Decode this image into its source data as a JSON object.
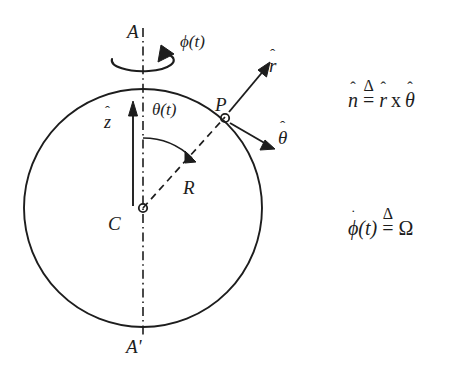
{
  "figure": {
    "background_color": "#ffffff",
    "stroke_color": "#1d1d1d",
    "labels": {
      "axis_top": "A",
      "axis_bottom": "A'",
      "spin_angle": "ϕ(t)",
      "polar_angle": "θ(t)",
      "z_axis_symbol": "z",
      "z_axis_hat": "ˆ",
      "radius": "R",
      "center": "C",
      "point": "P",
      "r_unit_symbol": "r",
      "r_unit_hat": "ˆ",
      "theta_unit_symbol": "θ",
      "theta_unit_hat": "ˆ"
    },
    "equations": {
      "normal_definition": {
        "lhs_symbol": "n",
        "lhs_hat": "ˆ",
        "relation": "=",
        "relation_mark": "Δ",
        "rhs_first_symbol": "r",
        "rhs_first_hat": "ˆ",
        "operator": "x",
        "rhs_second_symbol": "θ",
        "rhs_second_hat": "ˆ"
      },
      "spin_rate_definition": {
        "lhs_symbol": "ϕ",
        "lhs_dot": "˙",
        "lhs_argument": "(t)",
        "relation": "=",
        "relation_mark": "Δ",
        "rhs": "Ω"
      }
    },
    "geometry": {
      "sphere_center_x": 143,
      "sphere_center_y": 208,
      "sphere_radius": 119,
      "point_P_x": 225,
      "point_P_y": 117,
      "center_marker_radius": 4,
      "point_marker_radius": 4
    }
  }
}
